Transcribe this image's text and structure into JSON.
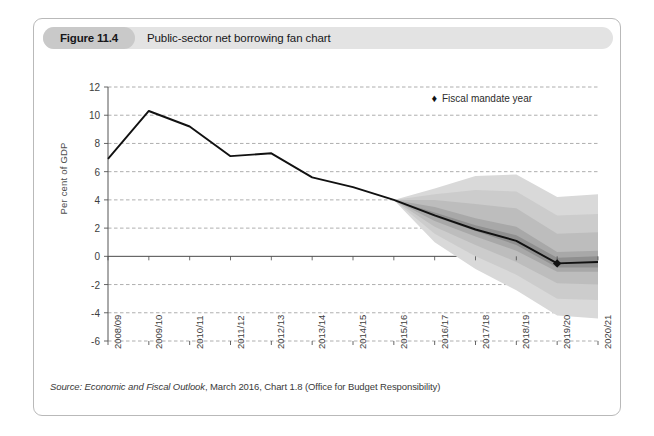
{
  "figure": {
    "number": "Figure 11.4",
    "title": "Public-sector net borrowing fan chart"
  },
  "source": {
    "label": "Source:",
    "publication": " Economic and Fiscal Outlook",
    "rest": ", March 2016, Chart 1.8 (Office for Budget Responsibility)"
  },
  "legend": {
    "marker": "♦",
    "label": "Fiscal mandate year"
  },
  "chart_data": {
    "type": "area",
    "title": "Public-sector net borrowing fan chart",
    "xlabel": "",
    "ylabel": "Per cent of GDP",
    "ylim": [
      -6,
      12
    ],
    "yticks": [
      12,
      10,
      8,
      6,
      4,
      2,
      0,
      -2,
      -4,
      -6
    ],
    "ytick_labels": [
      "12",
      "10",
      "8",
      "6",
      "4",
      "2",
      "0",
      "-2",
      "-4",
      "-6"
    ],
    "grid": "horizontal-dashed",
    "legend_position": "top-right",
    "categories": [
      "2008/09",
      "2009/10",
      "2010/11",
      "2011/12",
      "2012/13",
      "2013/14",
      "2014/15",
      "2015/16",
      "2016/17",
      "2017/18",
      "2018/19",
      "2019/20",
      "2020/21"
    ],
    "series": [
      {
        "name": "Public-sector net borrowing (central projection)",
        "values": [
          6.9,
          10.3,
          9.2,
          7.1,
          7.3,
          5.6,
          4.9,
          4.0,
          2.9,
          1.9,
          1.1,
          -0.5,
          -0.4
        ]
      }
    ],
    "fan_bands": [
      {
        "name": "90% probability interval",
        "shade": "#d9d9d9",
        "lower": [
          null,
          null,
          null,
          null,
          null,
          null,
          null,
          4.0,
          1.0,
          -0.9,
          -2.4,
          -4.2,
          -4.4
        ],
        "upper": [
          null,
          null,
          null,
          null,
          null,
          null,
          null,
          4.0,
          4.8,
          5.7,
          5.8,
          4.2,
          4.4
        ]
      },
      {
        "name": "70% probability interval",
        "shade": "#cccccc",
        "lower": [
          null,
          null,
          null,
          null,
          null,
          null,
          null,
          4.0,
          1.6,
          0.0,
          -1.3,
          -3.0,
          -3.1
        ],
        "upper": [
          null,
          null,
          null,
          null,
          null,
          null,
          null,
          4.0,
          4.4,
          4.7,
          4.6,
          2.9,
          3.0
        ]
      },
      {
        "name": "50% probability interval",
        "shade": "#bdbdbd",
        "lower": [
          null,
          null,
          null,
          null,
          null,
          null,
          null,
          4.0,
          2.1,
          0.8,
          -0.4,
          -1.9,
          -2.0
        ],
        "upper": [
          null,
          null,
          null,
          null,
          null,
          null,
          null,
          4.0,
          4.0,
          3.7,
          3.4,
          1.6,
          1.7
        ]
      },
      {
        "name": "30% probability interval",
        "shade": "#a8a8a8",
        "lower": [
          null,
          null,
          null,
          null,
          null,
          null,
          null,
          4.0,
          2.5,
          1.4,
          0.4,
          -1.1,
          -1.1
        ],
        "upper": [
          null,
          null,
          null,
          null,
          null,
          null,
          null,
          4.0,
          3.5,
          2.7,
          2.1,
          0.3,
          0.4
        ]
      },
      {
        "name": "10% probability interval",
        "shade": "#8f8f8f",
        "lower": [
          null,
          null,
          null,
          null,
          null,
          null,
          null,
          4.0,
          2.8,
          1.8,
          0.8,
          -0.8,
          -0.8
        ],
        "upper": [
          null,
          null,
          null,
          null,
          null,
          null,
          null,
          4.0,
          3.1,
          2.2,
          1.5,
          -0.1,
          0.0
        ]
      }
    ],
    "markers": [
      {
        "name": "fiscal-mandate-year",
        "category": "2019/20",
        "value": -0.5,
        "symbol": "diamond"
      }
    ]
  }
}
